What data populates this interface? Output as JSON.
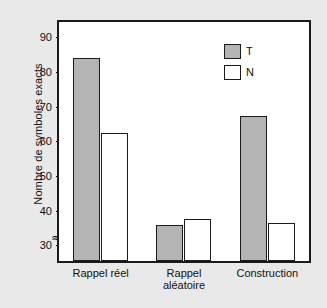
{
  "chart_data": {
    "type": "bar",
    "title": "",
    "xlabel": "",
    "ylabel": "Nombre de symboles exacts",
    "categories": [
      "Rappel réel",
      "Rappel aléatoire",
      "Construction"
    ],
    "category_lines": [
      [
        "Rappel réel"
      ],
      [
        "Rappel",
        "aléatoire"
      ],
      [
        "Construction"
      ]
    ],
    "series": [
      {
        "name": "T",
        "color": "#b4b4b4",
        "values": [
          84.5,
          36.5,
          68.0
        ]
      },
      {
        "name": "N",
        "color": "#ffffff",
        "values": [
          63.0,
          38.0,
          37.0
        ]
      }
    ],
    "ylim": [
      26,
      95
    ],
    "yticks": [
      30,
      40,
      50,
      60,
      70,
      80,
      90
    ],
    "ytick_labels": [
      "30",
      "40",
      "50",
      "60",
      "70",
      "80",
      "90"
    ],
    "axis_break": "≈",
    "axis_break_note": "y-axis broken below 30",
    "grid": false,
    "legend": {
      "position": "top-right",
      "entries": [
        {
          "label": "T",
          "color": "#b4b4b4"
        },
        {
          "label": "N",
          "color": "#ffffff"
        }
      ]
    },
    "colors": {
      "series_t": "#b4b4b4",
      "series_n": "#ffffff",
      "axis": "#1a1a1a",
      "plot_background": "#ffffff",
      "page_background": "#e9e9e9"
    }
  }
}
